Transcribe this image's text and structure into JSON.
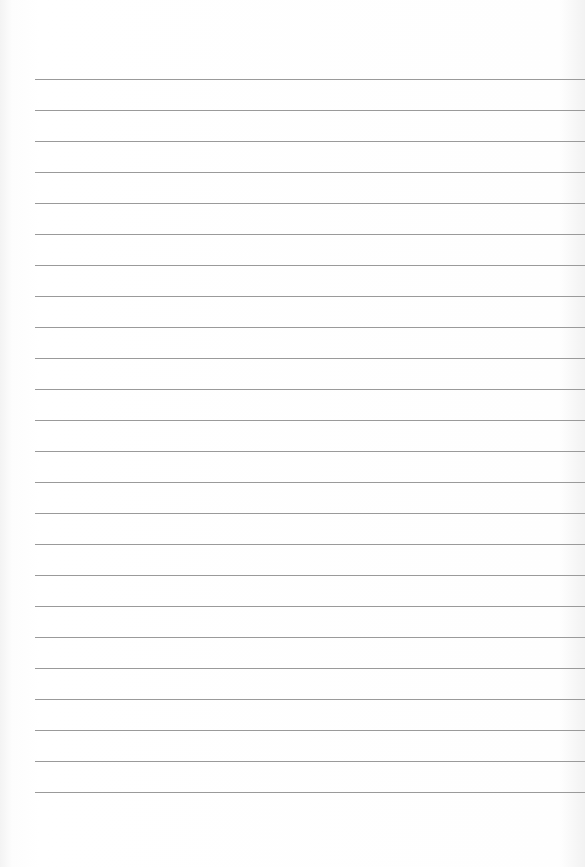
{
  "document": {
    "type": "lined-paper",
    "line_count": 24,
    "first_line_y": 79,
    "line_spacing": 31,
    "line_left": 35,
    "line_color": "#9a9a9a",
    "background_color": "#fefefe"
  }
}
